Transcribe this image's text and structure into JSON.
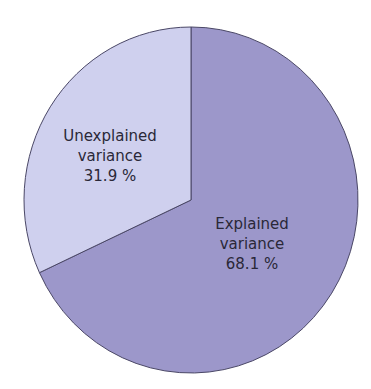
{
  "chart_data": {
    "type": "pie",
    "title": "",
    "categories": [
      "Explained variance",
      "Unexplained variance"
    ],
    "values": [
      68.1,
      31.9
    ],
    "unit": "%",
    "colors": [
      "#9c97ca",
      "#cfd0ee"
    ],
    "labels": [
      {
        "line1": "Explained",
        "line2": "variance",
        "value": "68.1 %"
      },
      {
        "line1": "Unexplained",
        "line2": "variance",
        "value": "31.9 %"
      }
    ],
    "legend": "none"
  }
}
